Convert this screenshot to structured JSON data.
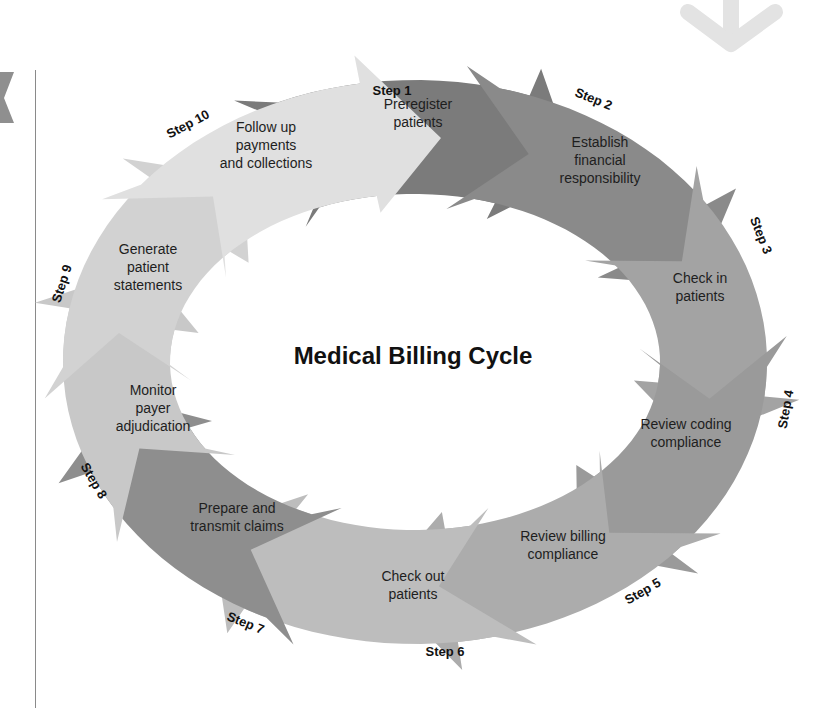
{
  "diagram": {
    "title": "Medical Billing Cycle",
    "steps": [
      {
        "step": "Step 1",
        "lines": [
          "Preregister",
          "patients"
        ],
        "color": "#7b7b7b"
      },
      {
        "step": "Step 2",
        "lines": [
          "Establish",
          "financial",
          "responsibility"
        ],
        "color": "#8a8a8a"
      },
      {
        "step": "Step 3",
        "lines": [
          "Check in",
          "patients"
        ],
        "color": "#a3a3a3"
      },
      {
        "step": "Step 4",
        "lines": [
          "Review coding",
          "compliance"
        ],
        "color": "#9a9a9a"
      },
      {
        "step": "Step 5",
        "lines": [
          "Review billing",
          "compliance"
        ],
        "color": "#acacac"
      },
      {
        "step": "Step 6",
        "lines": [
          "Check out",
          "patients"
        ],
        "color": "#bdbdbd"
      },
      {
        "step": "Step 7",
        "lines": [
          "Prepare and",
          "transmit claims"
        ],
        "color": "#8e8e8e"
      },
      {
        "step": "Step 8",
        "lines": [
          "Monitor",
          "payer",
          "adjudication"
        ],
        "color": "#c8c8c8"
      },
      {
        "step": "Step 9",
        "lines": [
          "Generate",
          "patient",
          "statements"
        ],
        "color": "#d2d2d2"
      },
      {
        "step": "Step 10",
        "lines": [
          "Follow up",
          "payments",
          "and collections"
        ],
        "color": "#e0e0e0"
      }
    ]
  },
  "decor": {
    "top_right_arrow_color": "#e3e3e3",
    "left_tab_color": "#8f8f8f"
  }
}
